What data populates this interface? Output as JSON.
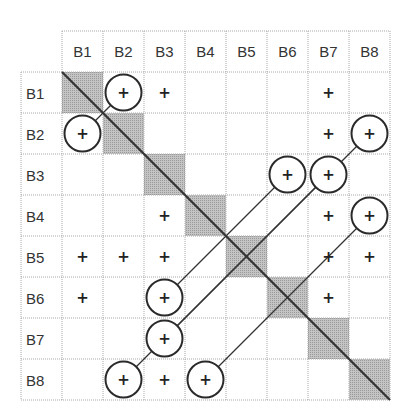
{
  "matrix": {
    "columns": [
      "B1",
      "B2",
      "B3",
      "B4",
      "B5",
      "B6",
      "B7",
      "B8"
    ],
    "rows": [
      "B1",
      "B2",
      "B3",
      "B4",
      "B5",
      "B6",
      "B7",
      "B8"
    ],
    "diagonal_fill": "#bdbdbd",
    "grid_color": "#a8a8a8",
    "line_color": "#333333",
    "symbol": "+",
    "marks": [
      {
        "row": "B1",
        "col": "B2",
        "circled": true
      },
      {
        "row": "B1",
        "col": "B3",
        "circled": false
      },
      {
        "row": "B1",
        "col": "B7",
        "circled": false
      },
      {
        "row": "B2",
        "col": "B1",
        "circled": true
      },
      {
        "row": "B2",
        "col": "B7",
        "circled": false
      },
      {
        "row": "B2",
        "col": "B8",
        "circled": true
      },
      {
        "row": "B3",
        "col": "B6",
        "circled": true
      },
      {
        "row": "B3",
        "col": "B7",
        "circled": true
      },
      {
        "row": "B4",
        "col": "B3",
        "circled": false
      },
      {
        "row": "B4",
        "col": "B7",
        "circled": false
      },
      {
        "row": "B4",
        "col": "B8",
        "circled": true
      },
      {
        "row": "B5",
        "col": "B1",
        "circled": false
      },
      {
        "row": "B5",
        "col": "B2",
        "circled": false
      },
      {
        "row": "B5",
        "col": "B3",
        "circled": false
      },
      {
        "row": "B5",
        "col": "B7",
        "circled": false
      },
      {
        "row": "B5",
        "col": "B8",
        "circled": false
      },
      {
        "row": "B6",
        "col": "B1",
        "circled": false
      },
      {
        "row": "B6",
        "col": "B3",
        "circled": true
      },
      {
        "row": "B6",
        "col": "B7",
        "circled": false
      },
      {
        "row": "B7",
        "col": "B3",
        "circled": true
      },
      {
        "row": "B8",
        "col": "B2",
        "circled": true
      },
      {
        "row": "B8",
        "col": "B3",
        "circled": false
      },
      {
        "row": "B8",
        "col": "B4",
        "circled": true
      }
    ],
    "connections": [
      {
        "from": {
          "row": "B1",
          "col": "B2"
        },
        "to": {
          "row": "B2",
          "col": "B1"
        }
      },
      {
        "from": {
          "row": "B3",
          "col": "B6"
        },
        "to": {
          "row": "B6",
          "col": "B3"
        }
      },
      {
        "from": {
          "row": "B3",
          "col": "B7"
        },
        "to": {
          "row": "B7",
          "col": "B3"
        }
      },
      {
        "from": {
          "row": "B2",
          "col": "B8"
        },
        "to": {
          "row": "B8",
          "col": "B2"
        }
      },
      {
        "from": {
          "row": "B4",
          "col": "B8"
        },
        "to": {
          "row": "B8",
          "col": "B4"
        }
      }
    ]
  }
}
